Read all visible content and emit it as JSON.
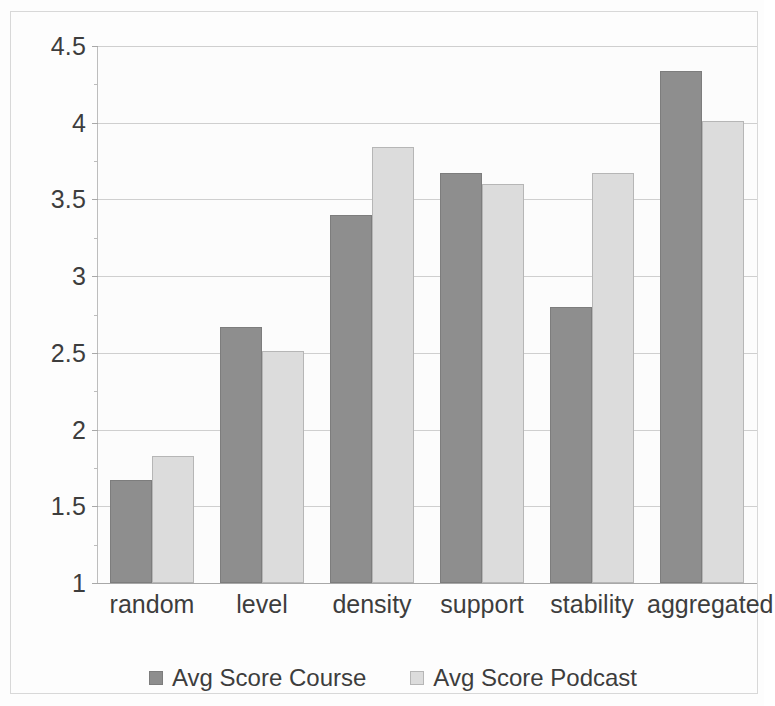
{
  "chart_data": {
    "type": "bar",
    "title": "",
    "subtitle": "",
    "xlabel": "",
    "ylabel": "",
    "categories": [
      "random",
      "level",
      "density",
      "support",
      "stability",
      "aggregated"
    ],
    "series": [
      {
        "name": "Avg Score Course",
        "color": "#8e8e8e",
        "values": [
          1.67,
          2.67,
          3.4,
          3.67,
          2.8,
          4.34
        ]
      },
      {
        "name": "Avg Score Podcast",
        "color": "#dcdcdc",
        "values": [
          1.83,
          2.51,
          3.84,
          3.6,
          3.67,
          4.01
        ]
      }
    ],
    "ylim": [
      1,
      4.5
    ],
    "ytick_labels": [
      "1",
      "1.5",
      "2",
      "2.5",
      "3",
      "3.5",
      "4",
      "4.5"
    ],
    "ytick_values": [
      1,
      1.5,
      2,
      2.5,
      3,
      3.5,
      4,
      4.5
    ],
    "grid": true,
    "grid_axis": "y",
    "legend_position": "bottom",
    "legend_entries": [
      "Avg Score Course",
      "Avg Score Podcast"
    ],
    "annotations": [],
    "plot_background": "#fcfcfc",
    "frame_color": "#d8d8d8"
  }
}
